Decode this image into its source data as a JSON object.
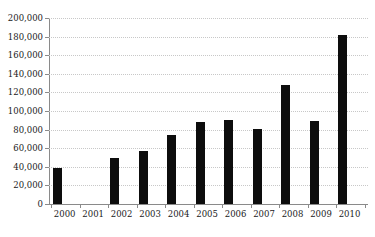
{
  "chart_data": {
    "type": "bar",
    "title": "",
    "subtitle": "",
    "xlabel": "",
    "ylabel": "",
    "categories": [
      "2000",
      "2001",
      "2002",
      "2003",
      "2004",
      "2005",
      "2006",
      "2007",
      "2008",
      "2009",
      "2010"
    ],
    "values": [
      39000,
      null,
      50000,
      57000,
      74000,
      88000,
      90000,
      81000,
      128000,
      89000,
      182000
    ],
    "ylim": [
      0,
      200000
    ],
    "y_ticks": [
      0,
      20000,
      40000,
      60000,
      80000,
      100000,
      120000,
      140000,
      160000,
      180000,
      200000
    ],
    "y_tick_labels": [
      "0",
      "20,000",
      "40,000",
      "60,000",
      "80,000",
      "100,000",
      "120,000",
      "140,000",
      "160,000",
      "180,000",
      "200,000"
    ],
    "grid": true,
    "grid_axis": "y",
    "legend": false,
    "legend_position": "none",
    "series": [
      {
        "name": "",
        "color": "#0d0d0d",
        "values": [
          39000,
          null,
          50000,
          57000,
          74000,
          88000,
          90000,
          81000,
          128000,
          89000,
          182000
        ]
      }
    ]
  },
  "colors": {
    "bar": "#0d0d0d",
    "background": "#ffffff",
    "grid": "#c8c8c8",
    "axis": "#8a8a8a",
    "text": "#1a1a1a"
  }
}
